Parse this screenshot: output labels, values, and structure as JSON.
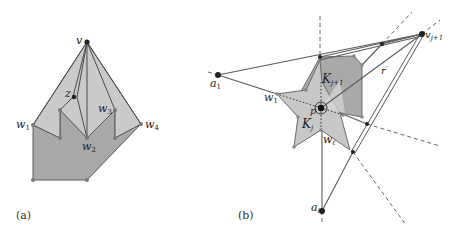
{
  "figure_a": {
    "caption": "(a)",
    "labels": {
      "v": "v",
      "z": "z",
      "w1": "w",
      "w1_sub": "1",
      "w2": "w",
      "w2_sub": "2",
      "w3": "w",
      "w3_sub": "3",
      "w4": "w",
      "w4_sub": "4"
    }
  },
  "figure_b": {
    "caption": "(b)",
    "labels": {
      "a1": "a",
      "a1_sub": "1",
      "al": "a",
      "al_sub": "ℓ",
      "vj1": "v",
      "vj1_sub": "j+1",
      "w1": "w",
      "w1_sub": "1",
      "wl": "w",
      "wl_sub": "ℓ",
      "Kj1": "K",
      "Kj1_sub": "j+1",
      "Kj": "K",
      "Kj_sub": "j",
      "p": "p",
      "r": "r",
      "r_sup": "′"
    }
  },
  "colors": {
    "light_fill": "#c8c8c8",
    "dark_fill": "#a9a9a9",
    "stroke": "#5a5a5a",
    "vertex": "#222222",
    "dashed": "#666666"
  }
}
